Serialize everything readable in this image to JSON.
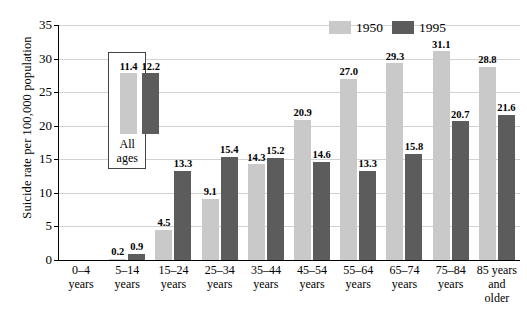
{
  "chart_data": {
    "type": "bar",
    "title": "",
    "xlabel": "",
    "ylabel": "Suicide rate per 100,000 population",
    "ylim": [
      0,
      35
    ],
    "yticks": [
      0,
      5,
      10,
      15,
      20,
      25,
      30,
      35
    ],
    "grid": true,
    "legend_position": "top-right",
    "categories": [
      "0–4 years",
      "5–14 years",
      "15–24 years",
      "25–34 years",
      "35–44 years",
      "45–54 years",
      "55–64 years",
      "65–74 years",
      "75–84 years",
      "85 years and older"
    ],
    "category_lines": [
      [
        "0–4",
        "years"
      ],
      [
        "5–14",
        "years"
      ],
      [
        "15–24",
        "years"
      ],
      [
        "25–34",
        "years"
      ],
      [
        "35–44",
        "years"
      ],
      [
        "45–54",
        "years"
      ],
      [
        "55–64",
        "years"
      ],
      [
        "65–74",
        "years"
      ],
      [
        "75–84",
        "years"
      ],
      [
        "85 years",
        "and",
        "older"
      ]
    ],
    "series": [
      {
        "name": "1950",
        "color": "#c9c9c9",
        "values": [
          null,
          0.2,
          4.5,
          9.1,
          14.3,
          20.9,
          27.0,
          29.3,
          31.1,
          28.8
        ],
        "labels": [
          "",
          "0.2",
          "4.5",
          "9.1",
          "14.3",
          "20.9",
          "27.0",
          "29.3",
          "31.1",
          "28.8"
        ]
      },
      {
        "name": "1995",
        "color": "#5c5c5c",
        "values": [
          null,
          0.9,
          13.3,
          15.4,
          15.2,
          14.6,
          13.3,
          15.8,
          20.7,
          21.6
        ],
        "labels": [
          "",
          "0.9",
          "13.3",
          "15.4",
          "15.2",
          "14.6",
          "13.3",
          "15.8",
          "20.7",
          "21.6"
        ]
      }
    ],
    "inset": {
      "caption_lines": [
        "All",
        "ages"
      ],
      "series": [
        {
          "name": "1950",
          "value": 11.4,
          "label": "11.4",
          "color": "#c9c9c9"
        },
        {
          "name": "1995",
          "value": 12.2,
          "label": "12.2",
          "color": "#5c5c5c"
        }
      ]
    },
    "legend": [
      {
        "label": "1950",
        "color": "#c9c9c9"
      },
      {
        "label": "1995",
        "color": "#5c5c5c"
      }
    ]
  }
}
